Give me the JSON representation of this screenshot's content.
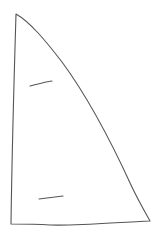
{
  "drawing": {
    "subject": "sail sketch",
    "stroke_color": "#555555",
    "background": "#ffffff",
    "elements": [
      "sail-outline",
      "batten-upper",
      "batten-lower"
    ]
  }
}
